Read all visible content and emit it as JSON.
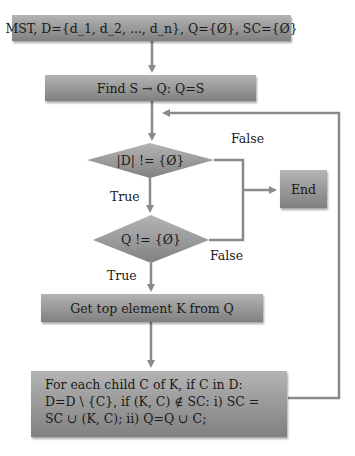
{
  "diagram": {
    "type": "flowchart",
    "colors": {
      "box_top": "#b4b4b4",
      "box_bottom": "#808080",
      "connector": "#8a8a8a",
      "text": "#1a1a1a",
      "background": "#ffffff"
    },
    "nodes": {
      "init": {
        "shape": "rect",
        "label": "MST, D={d_1, d_2, ..., d_n}, Q={Ø}, SC={Ø}"
      },
      "find_s": {
        "shape": "rect",
        "label": "Find S → Q: Q=S"
      },
      "check_d": {
        "shape": "diamond",
        "label": "|D| != {Ø}"
      },
      "end": {
        "shape": "rect",
        "label": "End"
      },
      "check_q": {
        "shape": "diamond",
        "label": "Q != {Ø}"
      },
      "get_top": {
        "shape": "rect",
        "label": "Get top element K from Q"
      },
      "for_each": {
        "shape": "rect",
        "lines": [
          "For each child C of K, if C in D:",
          "D=D \\ {C}, if (K, C) ∉ SC: i) SC =",
          "SC ∪ (K, C); ii) Q=Q ∪ C;"
        ]
      }
    },
    "edge_labels": {
      "check_d_false": "False",
      "check_d_true": "True",
      "check_q_false": "False",
      "check_q_true": "True"
    },
    "edges": [
      {
        "from": "init",
        "to": "find_s"
      },
      {
        "from": "find_s",
        "to": "check_d"
      },
      {
        "from": "check_d",
        "to": "end",
        "label": "False"
      },
      {
        "from": "check_d",
        "to": "check_q",
        "label": "True"
      },
      {
        "from": "check_q",
        "to": "end",
        "label": "False"
      },
      {
        "from": "check_q",
        "to": "get_top",
        "label": "True"
      },
      {
        "from": "get_top",
        "to": "for_each"
      },
      {
        "from": "for_each",
        "to": "check_d",
        "label": "loop back"
      }
    ]
  }
}
